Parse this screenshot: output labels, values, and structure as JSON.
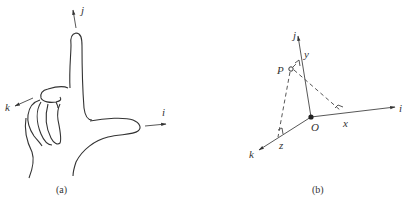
{
  "figure": {
    "panel_a": {
      "caption": "(a)",
      "axes": [
        {
          "label": "j",
          "direction": "up (index finger)"
        },
        {
          "label": "i",
          "direction": "right (thumb)"
        },
        {
          "label": "k",
          "direction": "toward viewer, lower-left (middle finger)"
        }
      ]
    },
    "panel_b": {
      "caption": "(b)",
      "origin_label": "O",
      "point_label": "P",
      "axes": [
        {
          "label": "j"
        },
        {
          "label": "i"
        },
        {
          "label": "k"
        }
      ],
      "projection_labels": {
        "x": "x",
        "y": "y",
        "z": "z"
      }
    }
  }
}
